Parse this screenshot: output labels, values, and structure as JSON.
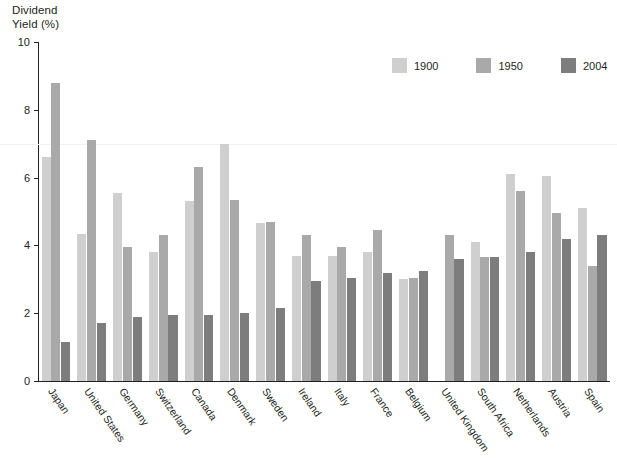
{
  "chart_data": {
    "type": "bar",
    "title": "",
    "xlabel": "",
    "ylabel": "Dividend\nYield (%)",
    "ylim": [
      0,
      10
    ],
    "yticks": [
      0,
      2,
      4,
      6,
      8,
      10
    ],
    "ytick_labels": [
      "0",
      "2",
      "4",
      "6",
      "8",
      "10"
    ],
    "grid": false,
    "legend_position": "top-right",
    "categories": [
      "Japan",
      "United States",
      "Germany",
      "Switzerland",
      "Canada",
      "Denmark",
      "Sweden",
      "Ireland",
      "Italy",
      "France",
      "Belgium",
      "United Kingdom",
      "South Africa",
      "Netherlands",
      "Austria",
      "Spain"
    ],
    "series": [
      {
        "name": "1900",
        "color": "#cfcfcf",
        "values": [
          6.6,
          4.35,
          5.55,
          3.8,
          5.3,
          7.0,
          4.65,
          3.7,
          3.7,
          3.8,
          3.0,
          0.0,
          4.1,
          6.1,
          6.05,
          5.1
        ]
      },
      {
        "name": "1950",
        "color": "#a9a9a9",
        "values": [
          8.8,
          7.1,
          3.95,
          4.3,
          6.3,
          5.35,
          4.7,
          4.3,
          3.95,
          4.45,
          3.05,
          4.3,
          3.65,
          5.6,
          4.95,
          3.4
        ]
      },
      {
        "name": "2004",
        "color": "#7d7d7d",
        "values": [
          1.15,
          1.7,
          1.9,
          1.95,
          1.95,
          2.0,
          2.15,
          2.95,
          3.05,
          3.2,
          3.25,
          3.6,
          3.65,
          3.8,
          4.2,
          4.3
        ]
      }
    ]
  },
  "legend": {
    "items": [
      {
        "label": "1900",
        "color": "#cfcfcf"
      },
      {
        "label": "1950",
        "color": "#a9a9a9"
      },
      {
        "label": "2004",
        "color": "#7d7d7d"
      }
    ]
  },
  "axis": {
    "y_title_line1": "Dividend",
    "y_title_line2": "Yield (%)"
  }
}
